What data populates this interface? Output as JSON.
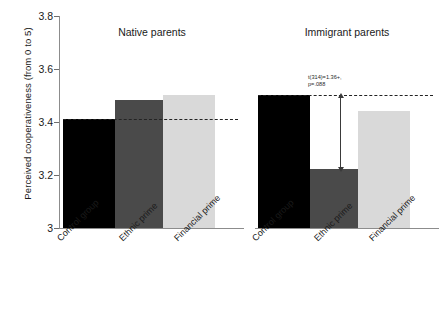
{
  "chart_data": {
    "type": "bar",
    "title": "",
    "xlabel": "",
    "ylabel": "Perceived cooperativeness (from 0 to 5)",
    "ylim": [
      3,
      3.8
    ],
    "yticks": [
      3,
      3.2,
      3.4,
      3.6,
      3.8
    ],
    "ytick_labels": [
      "3",
      "3.2",
      "3.4",
      "3.6",
      "3.8"
    ],
    "grid": false,
    "legend": "none",
    "categories": [
      "Control group",
      "Ethnic prime",
      "Financial prime"
    ],
    "panels": [
      {
        "title": "Native parents",
        "values": [
          3.41,
          3.48,
          3.5
        ],
        "colors": [
          "#000000",
          "#4a4a4a",
          "#d9d9d9"
        ],
        "reference_line": 3.41,
        "annotation": null
      },
      {
        "title": "Immigrant parents",
        "values": [
          3.5,
          3.22,
          3.44
        ],
        "colors": [
          "#000000",
          "#4a4a4a",
          "#d9d9d9"
        ],
        "reference_line": 3.5,
        "annotation": {
          "line1": "t(314)=1.36+,",
          "line2": "p=.088",
          "from": 3.5,
          "to": 3.22
        }
      }
    ]
  },
  "axis": {
    "y_label": "Perceived cooperativeness (from 0 to 5)",
    "tick_3": "3",
    "tick_32": "3.2",
    "tick_34": "3.4",
    "tick_36": "3.6",
    "tick_38": "3.8"
  },
  "panel_left": {
    "title": "Native parents",
    "cat_1": "Control group",
    "cat_2": "Ethnic prime",
    "cat_3": "Financial prime"
  },
  "panel_right": {
    "title": "Immigrant parents",
    "cat_1": "Control group",
    "cat_2": "Ethnic prime",
    "cat_3": "Financial prime",
    "stat_line1": "t(314)=1.36+,",
    "stat_line2": "p=.088"
  }
}
